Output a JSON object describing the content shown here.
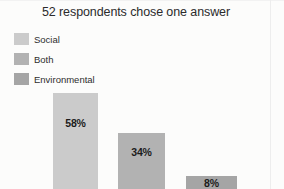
{
  "chart_data": {
    "type": "bar",
    "title": "52 respondents chose one answer",
    "xlabel": "",
    "ylabel": "",
    "categories": [
      "Social",
      "Both",
      "Environmental"
    ],
    "values": [
      58,
      34,
      8
    ],
    "value_labels": [
      "58%",
      "34%",
      "8%"
    ],
    "ylim": [
      0,
      100
    ],
    "grid": false,
    "legend_position": "top-left",
    "respondents": 52,
    "colors": [
      "#cbcbcb",
      "#b2b2b2",
      "#a5a5a5"
    ],
    "series": [
      {
        "name": "Percent of respondents",
        "values": [
          58,
          34,
          8
        ]
      }
    ],
    "bars": [
      {
        "category": "Social",
        "value": 58,
        "label": "58%",
        "color": "#cbcbcb"
      },
      {
        "category": "Both",
        "value": 34,
        "label": "34%",
        "color": "#b2b2b2"
      },
      {
        "category": "Environmental",
        "value": 8,
        "label": "8%",
        "color": "#a5a5a5"
      }
    ]
  },
  "legend": {
    "items": [
      {
        "label": "Social",
        "color": "#cbcbcb"
      },
      {
        "label": "Both",
        "color": "#b2b2b2"
      },
      {
        "label": "Environmental",
        "color": "#a5a5a5"
      }
    ]
  }
}
